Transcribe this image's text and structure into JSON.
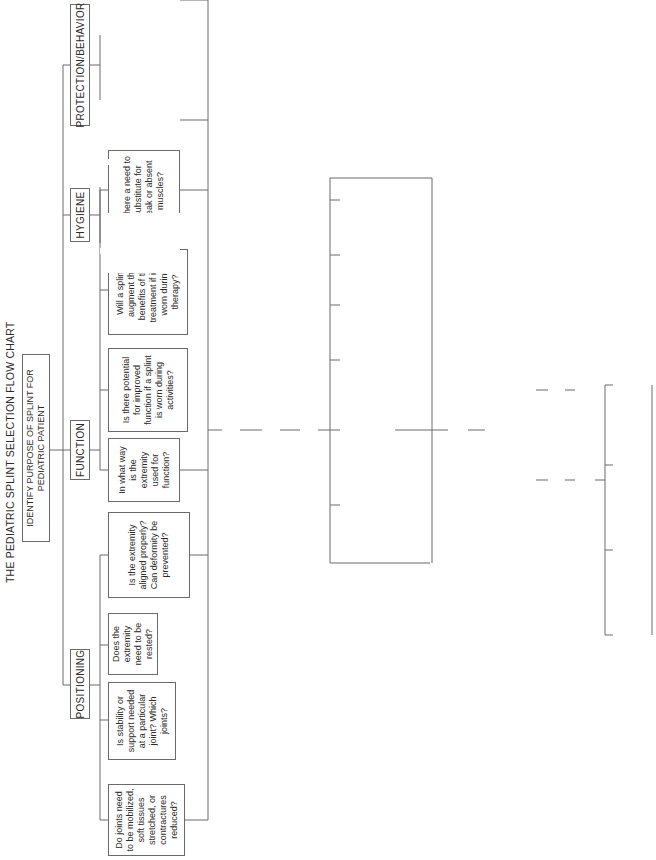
{
  "title": "THE PEDIATRIC SPLINT SELECTION FLOW CHART",
  "root": "IDENTIFY PURPOSE OF SPLINT FOR PEDIATRIC PATIENT",
  "categories": [
    {
      "label": "POSITIONING",
      "questions": [
        "Do joints need to be mobilized, soft tissues stretched, or contractures reduced?",
        "Is stability or support needed at a particular joint? Which joints?",
        "Does the extremity need to be rested?",
        "Is the extremity aligned properly? Can deformity be prevented?"
      ]
    },
    {
      "label": "FUNCTION",
      "questions": [
        "In what way is the extremity used for function?",
        "Is there potential for improved function if a splint is worn during activities?",
        "Will a splint augment the benefits of the treatment if it is worn during therapy?",
        "Is there a need to substitute for weak or absent muscles?"
      ]
    },
    {
      "label": "HYGIENE",
      "questions": [
        "What is the severity of the hygiene problem?",
        "Is there a potential hygiene problem?"
      ]
    },
    {
      "label": "PROTECTION/BEHAVIOR",
      "questions": [
        "Identify the behavior. How does it affect the child's ability to use the hand in a functional manner?",
        "Is a restraint needed?"
      ]
    }
  ],
  "steps": {
    "compare": "Compare and rate primary factors (above)",
    "establish": "Establish goal",
    "review": "Review secondary factors",
    "select": "Select type of splint",
    "fabricate": "Fabricate",
    "assess": "Assess splint to see if it meets identified goal",
    "yes": "YES",
    "no": "NO",
    "ongoing": "Ongoing assessment and monitoring",
    "determine": "Determine reason",
    "modify": "Modify or refabricate as needed"
  },
  "secondary_factors": [
    "Cost",
    "Physical attributes of the child",
    "Acceptance/ compliance",
    "Mechanical principles of splinting",
    "Sensory factors",
    "Cognition",
    "Developmental or functional level"
  ],
  "reasons": [
    "Reassess all secondary factors",
    "Was the splint fabricated correctly?",
    "Were the correct materials used?",
    "Has the child's presentation changed?"
  ]
}
